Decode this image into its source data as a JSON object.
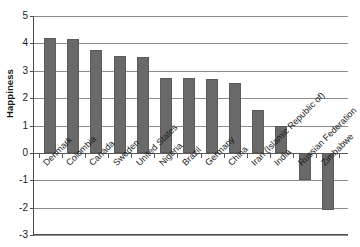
{
  "chart_data": {
    "type": "bar",
    "title": "",
    "subtitle": "",
    "xlabel": "",
    "ylabel": "Happiness",
    "ylim": [
      -3,
      5
    ],
    "yticks": [
      5,
      4,
      3,
      2,
      1,
      0,
      -1,
      -2,
      -3
    ],
    "ytick_labels": [
      "5",
      "4",
      "3",
      "2",
      "1",
      "0",
      "-1",
      "-2",
      "-3"
    ],
    "grid": true,
    "legend": "none",
    "orientation": "vertical",
    "bar_color": "#696969",
    "categories": [
      "Denmark",
      "Colombia",
      "Canada",
      "Sweden",
      "United States",
      "Nigeria",
      "Brazil",
      "Germany",
      "China",
      "Iran (Islamic Republic of)",
      "India",
      "Russian Federation",
      "Zimbabwe"
    ],
    "values": [
      4.2,
      4.15,
      3.75,
      3.55,
      3.5,
      2.75,
      2.75,
      2.7,
      2.55,
      1.55,
      1.0,
      -1.0,
      -2.1
    ],
    "annotations": []
  }
}
